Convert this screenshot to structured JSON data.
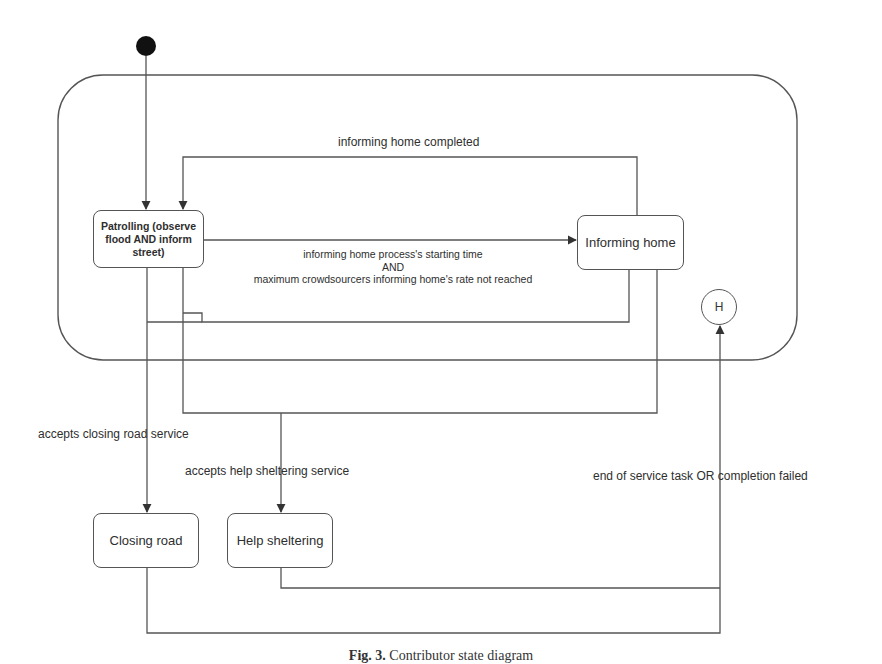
{
  "diagram": {
    "type": "state-machine",
    "composite_state": {
      "name": "Contributor active states"
    },
    "initial_state": {
      "icon": "filled-circle-initial-state"
    },
    "history_state": {
      "label": "H"
    },
    "states": {
      "patrolling": "Patrolling (observe flood AND inform street)",
      "informing_home": "Informing home",
      "closing_road": "Closing road",
      "help_sheltering": "Help sheltering"
    },
    "transitions": {
      "informing_home_completed": "informing home completed",
      "start_informing_line1": "informing home process's starting time",
      "start_informing_line2": "AND",
      "start_informing_line3": "maximum crowdsourcers informing home's rate not reached",
      "accepts_closing_road": "accepts closing road service",
      "accepts_help_sheltering": "accepts help sheltering service",
      "end_of_service": "end of service task OR completion failed"
    }
  },
  "caption": {
    "prefix": "Fig. 3.",
    "text": "Contributor state diagram"
  }
}
